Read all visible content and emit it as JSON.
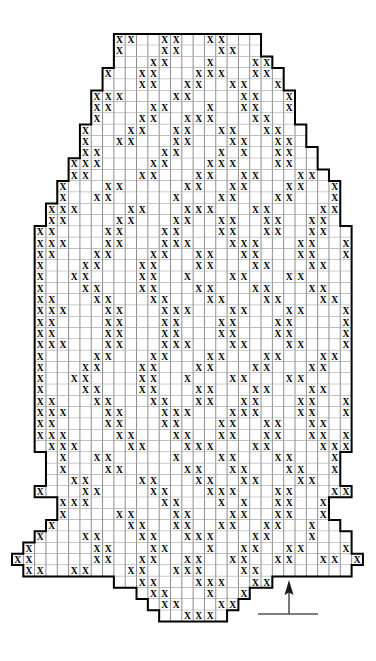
{
  "chart_data": {
    "type": "heatmap",
    "title": "",
    "subtitle": "",
    "xlabel": "",
    "ylabel": "",
    "grid": true,
    "legend_position": "bottom-right",
    "symbols": {
      "marked": "X",
      "blank": ""
    },
    "colors": {
      "cell_fill": "#ffffff",
      "grid_line": "#808080",
      "outline": "#000000",
      "symbol": "#000000",
      "background": "#ffffff"
    },
    "geometry": {
      "cell_width": 11.32,
      "cell_height": 11.3,
      "origin_x": 12,
      "origin_y": 34,
      "columns": 31,
      "rows": 52
    },
    "axis_ranges": {
      "columns": [
        0,
        31
      ],
      "rows": [
        0,
        52
      ]
    },
    "row_extents": [
      [
        9,
        22
      ],
      [
        9,
        22
      ],
      [
        9,
        23
      ],
      [
        8,
        24
      ],
      [
        8,
        24
      ],
      [
        7,
        25
      ],
      [
        7,
        25
      ],
      [
        7,
        25
      ],
      [
        6,
        26
      ],
      [
        6,
        26
      ],
      [
        6,
        27
      ],
      [
        5,
        27
      ],
      [
        5,
        28
      ],
      [
        4,
        29
      ],
      [
        4,
        29
      ],
      [
        3,
        29
      ],
      [
        3,
        29
      ],
      [
        2,
        30
      ],
      [
        2,
        30
      ],
      [
        2,
        30
      ],
      [
        2,
        30
      ],
      [
        2,
        30
      ],
      [
        2,
        30
      ],
      [
        2,
        30
      ],
      [
        2,
        30
      ],
      [
        2,
        30
      ],
      [
        2,
        30
      ],
      [
        2,
        30
      ],
      [
        2,
        30
      ],
      [
        2,
        30
      ],
      [
        2,
        30
      ],
      [
        2,
        30
      ],
      [
        2,
        30
      ],
      [
        2,
        30
      ],
      [
        2,
        30
      ],
      [
        2,
        30
      ],
      [
        2,
        30
      ],
      [
        3,
        29
      ],
      [
        3,
        29
      ],
      [
        3,
        29
      ],
      [
        2,
        30
      ],
      [
        4,
        28
      ],
      [
        4,
        28
      ],
      [
        3,
        29
      ],
      [
        2,
        30
      ],
      [
        1,
        30
      ],
      [
        0,
        31
      ],
      [
        1,
        30
      ],
      [
        9,
        23
      ],
      [
        11,
        21
      ],
      [
        12,
        20
      ],
      [
        13,
        19
      ]
    ],
    "marks": [
      [
        9,
        10,
        13,
        14,
        17,
        18
      ],
      [
        9,
        13,
        14,
        18,
        19
      ],
      [
        8,
        12,
        13,
        17,
        21,
        22
      ],
      [
        8,
        11,
        12,
        16,
        17,
        18,
        21,
        22
      ],
      [
        7,
        11,
        12,
        15,
        16,
        19,
        20,
        23,
        24
      ],
      [
        7,
        8,
        9,
        14,
        15,
        20,
        21,
        24,
        25
      ],
      [
        7,
        8,
        12,
        13,
        17,
        20,
        21,
        24
      ],
      [
        6,
        7,
        11,
        12,
        15,
        16,
        17,
        21,
        22,
        26
      ],
      [
        6,
        10,
        11,
        14,
        15,
        18,
        19,
        22,
        23,
        26
      ],
      [
        6,
        9,
        10,
        14,
        15,
        19,
        20,
        23,
        24,
        27
      ],
      [
        5,
        6,
        7,
        13,
        14,
        18,
        20,
        23,
        24,
        27,
        28,
        29
      ],
      [
        5,
        6,
        7,
        12,
        13,
        17,
        18,
        19,
        23,
        24,
        28,
        29,
        30
      ],
      [
        5,
        6,
        11,
        12,
        16,
        17,
        20,
        21,
        25,
        26,
        29,
        30
      ],
      [
        4,
        8,
        9,
        15,
        16,
        19,
        20,
        24,
        25,
        28,
        29
      ],
      [
        4,
        7,
        8,
        14,
        18,
        19,
        23,
        24,
        28
      ],
      [
        3,
        4,
        5,
        10,
        11,
        15,
        16,
        17,
        21,
        22,
        27,
        28,
        29
      ],
      [
        3,
        4,
        9,
        10,
        14,
        15,
        18,
        19,
        22,
        23,
        26,
        27,
        29
      ],
      [
        2,
        3,
        8,
        9,
        13,
        14,
        18,
        19,
        22,
        23,
        26,
        27,
        30
      ],
      [
        2,
        3,
        4,
        8,
        9,
        13,
        14,
        15,
        19,
        20,
        21,
        25,
        26,
        29,
        30
      ],
      [
        2,
        3,
        7,
        8,
        12,
        13,
        16,
        17,
        20,
        21,
        25,
        26,
        29,
        30
      ],
      [
        2,
        6,
        7,
        11,
        12,
        16,
        17,
        21,
        22,
        26,
        27,
        30
      ],
      [
        2,
        5,
        6,
        11,
        12,
        15,
        19,
        20,
        24,
        25,
        30
      ],
      [
        2,
        6,
        7,
        11,
        12,
        16,
        17,
        21,
        22,
        26,
        27,
        30
      ],
      [
        2,
        3,
        7,
        8,
        12,
        13,
        17,
        18,
        22,
        23,
        27,
        28,
        30
      ],
      [
        2,
        3,
        4,
        8,
        9,
        13,
        14,
        15,
        19,
        20,
        24,
        25,
        29,
        30
      ],
      [
        2,
        3,
        8,
        9,
        13,
        14,
        18,
        19,
        23,
        24,
        29,
        30
      ],
      [
        2,
        3,
        8,
        9,
        13,
        14,
        18,
        19,
        23,
        24,
        29,
        30
      ],
      [
        2,
        3,
        4,
        8,
        9,
        13,
        14,
        15,
        19,
        20,
        24,
        25,
        29,
        30
      ],
      [
        2,
        7,
        8,
        12,
        13,
        17,
        18,
        22,
        23,
        27,
        28,
        30
      ],
      [
        2,
        6,
        7,
        11,
        12,
        16,
        17,
        21,
        22,
        26,
        27,
        30
      ],
      [
        2,
        5,
        6,
        11,
        12,
        15,
        19,
        20,
        24,
        25,
        30
      ],
      [
        2,
        6,
        7,
        11,
        12,
        16,
        17,
        21,
        22,
        26,
        27,
        30
      ],
      [
        2,
        3,
        7,
        8,
        12,
        13,
        16,
        17,
        20,
        21,
        25,
        26,
        29,
        30
      ],
      [
        2,
        3,
        4,
        8,
        9,
        13,
        14,
        15,
        19,
        20,
        21,
        25,
        26,
        29,
        30
      ],
      [
        2,
        3,
        8,
        9,
        13,
        14,
        18,
        19,
        22,
        23,
        26,
        27,
        30
      ],
      [
        2,
        3,
        4,
        9,
        10,
        14,
        15,
        18,
        19,
        22,
        23,
        26,
        27,
        29
      ],
      [
        3,
        4,
        5,
        10,
        11,
        15,
        16,
        17,
        21,
        22,
        27,
        28,
        29
      ],
      [
        4,
        7,
        8,
        14,
        18,
        19,
        23,
        24,
        28
      ],
      [
        4,
        8,
        9,
        15,
        16,
        19,
        20,
        24,
        25,
        28,
        29
      ],
      [
        5,
        6,
        11,
        12,
        16,
        17,
        20,
        21,
        25,
        26,
        29,
        30
      ],
      [
        2,
        6,
        7,
        12,
        13,
        17,
        18,
        19,
        23,
        24,
        28,
        29
      ],
      [
        4,
        5,
        6,
        13,
        14,
        18,
        20,
        23,
        24,
        27,
        28
      ],
      [
        4,
        9,
        10,
        14,
        15,
        19,
        20,
        23,
        24,
        27
      ],
      [
        3,
        10,
        11,
        14,
        15,
        18,
        19,
        22,
        23,
        26
      ],
      [
        2,
        6,
        7,
        11,
        12,
        15,
        16,
        17,
        21,
        22,
        26
      ],
      [
        1,
        7,
        8,
        12,
        13,
        17,
        20,
        21,
        24,
        25,
        29,
        30
      ],
      [
        0,
        1,
        7,
        8,
        11,
        12,
        15,
        16,
        19,
        20,
        23,
        24,
        27,
        28,
        30,
        31
      ],
      [
        1,
        2,
        5,
        6,
        10,
        11,
        14,
        15,
        16,
        20,
        21
      ],
      [
        11,
        12,
        16,
        17,
        18,
        21,
        22
      ],
      [
        12,
        13,
        17,
        20,
        21
      ],
      [
        13,
        14,
        18,
        19
      ],
      [
        15,
        16,
        17
      ]
    ]
  },
  "legend": {
    "arrow_direction": "up",
    "arrow_label": "",
    "baseline_label": ""
  }
}
